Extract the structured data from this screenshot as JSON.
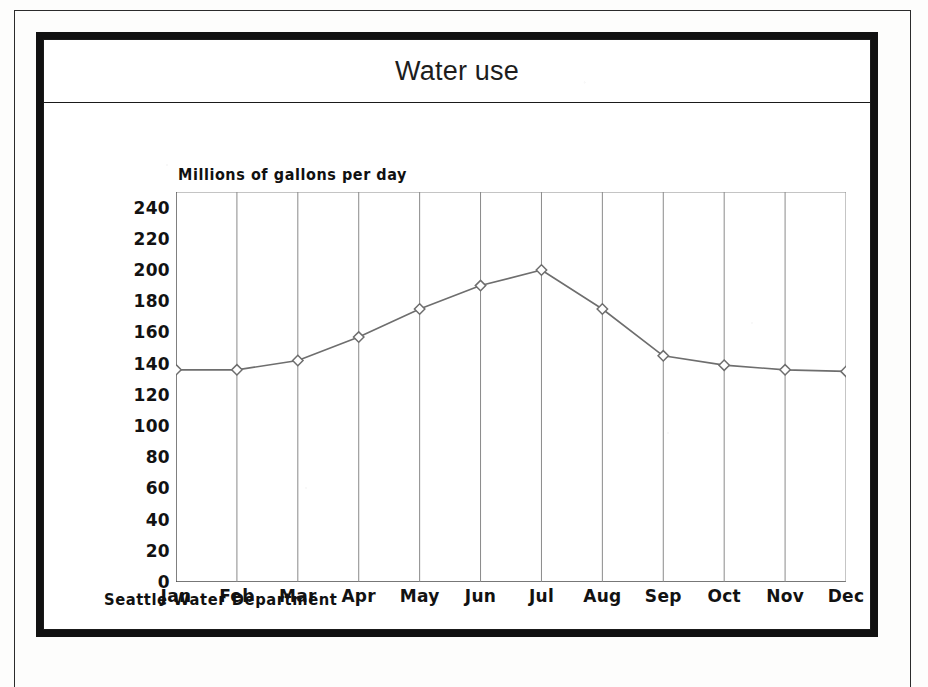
{
  "document": {
    "title": "Water use",
    "footer_note": "Seattle Water Department"
  },
  "chart_data": {
    "type": "line",
    "title": "Water use",
    "xlabel": "",
    "ylabel": "Millions of gallons per day",
    "ylabel_position": "above-axis",
    "categories": [
      "Jan",
      "Feb",
      "Mar",
      "Apr",
      "May",
      "Jun",
      "Jul",
      "Aug",
      "Sep",
      "Oct",
      "Nov",
      "Dec"
    ],
    "values": [
      136,
      136,
      142,
      157,
      175,
      190,
      200,
      175,
      145,
      139,
      136,
      135
    ],
    "series": [
      {
        "name": "Water use",
        "values": [
          136,
          136,
          142,
          157,
          175,
          190,
          200,
          175,
          145,
          139,
          136,
          135
        ]
      }
    ],
    "ylim": [
      0,
      250
    ],
    "ytick_values": [
      240,
      220,
      200,
      180,
      160,
      140,
      120,
      100,
      80,
      60,
      40,
      20,
      0
    ],
    "ytick_labels": [
      "240",
      "220",
      "200",
      "180",
      "160",
      "140",
      "120",
      "100",
      "80",
      "60",
      "40",
      "20",
      "0"
    ],
    "grid": {
      "vertical": true,
      "horizontal": false
    },
    "legend": "none",
    "marker": "diamond",
    "annotations": [
      "Seattle Water Department"
    ],
    "colors": {
      "line": "#6e6e6e",
      "marker_stroke": "#6e6e6e",
      "marker_fill": "#ffffff",
      "grid": "#8a8a8a",
      "axis": "#4a4a4a",
      "text": "#121212",
      "frame": "#111111",
      "background": "#ffffff"
    }
  }
}
